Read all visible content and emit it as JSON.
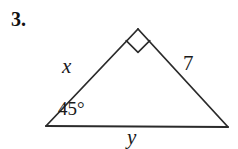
{
  "problem": {
    "number": "3."
  },
  "figure": {
    "type": "right-triangle-diagram",
    "stroke_color": "#2b2b2b",
    "background_color": "#ffffff",
    "vertices": {
      "apex": {
        "x": 138,
        "y": 29
      },
      "left": {
        "x": 46,
        "y": 126
      },
      "right": {
        "x": 228,
        "y": 127
      }
    },
    "right_angle_marker": {
      "at_vertex": "apex",
      "size": 17
    },
    "labels": {
      "left_side": "x",
      "right_side": "7",
      "base": "y",
      "left_angle": "45°"
    }
  }
}
